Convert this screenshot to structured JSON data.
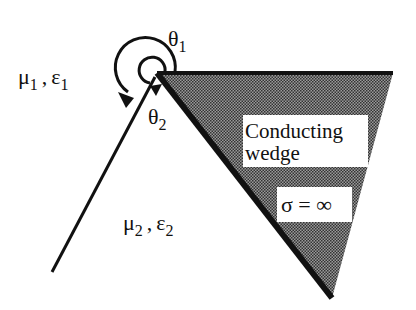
{
  "diagram": {
    "region1": {
      "mu": "μ",
      "mu_sub": "1",
      "sep": ",",
      "eps": "ε",
      "eps_sub": "1"
    },
    "region2": {
      "mu": "μ",
      "mu_sub": "2",
      "sep": ",",
      "eps": "ε",
      "eps_sub": "2"
    },
    "angle1": {
      "symbol": "θ",
      "sub": "1"
    },
    "angle2": {
      "symbol": "θ",
      "sub": "2"
    },
    "wedge_label_line1": "Conducting",
    "wedge_label_line2": "wedge",
    "conductivity": "σ = ∞",
    "colors": {
      "line": "#111111",
      "wedge_fill": "#7a7a7a",
      "background": "#ffffff"
    }
  }
}
